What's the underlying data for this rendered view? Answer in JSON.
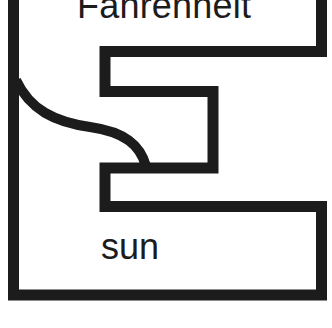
{
  "diagram": {
    "top_label": "Fahrenheit",
    "bottom_label": "sun",
    "stroke_color": "#1c1c1c",
    "background_color": "#ffffff"
  }
}
